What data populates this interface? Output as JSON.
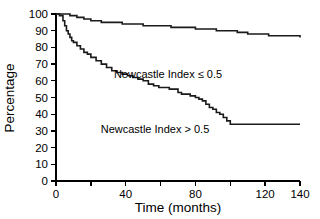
{
  "chart_data": {
    "type": "line",
    "subtype": "kaplan-meier-step",
    "title": "",
    "xlabel": "Time (months)",
    "ylabel": "Percentage",
    "xlim": [
      0,
      140
    ],
    "ylim": [
      0,
      100
    ],
    "xticks": [
      0,
      20,
      40,
      60,
      80,
      100,
      120,
      140
    ],
    "xtick_labels": [
      "0",
      "",
      "40",
      "",
      "80",
      "",
      "120",
      "140"
    ],
    "xtick_labels_major": [
      "0",
      "40",
      "80",
      "120",
      "140"
    ],
    "yticks": [
      0,
      10,
      20,
      30,
      40,
      50,
      60,
      70,
      80,
      90,
      100
    ],
    "ytick_labels": [
      "0",
      "10",
      "20",
      "30",
      "40",
      "50",
      "60",
      "70",
      "80",
      "90",
      "100"
    ],
    "grid": false,
    "legend_position": "inline-annotations",
    "series": [
      {
        "name": "Newcastle Index ≤ 0.5",
        "label_x": 168,
        "label_y": 78,
        "color": "#1a1a1a",
        "x": [
          0,
          4,
          8,
          12,
          16,
          20,
          26,
          32,
          38,
          44,
          50,
          56,
          62,
          66,
          70,
          74,
          80,
          86,
          92,
          98,
          104,
          110,
          116,
          122,
          128,
          134,
          140,
          146,
          152,
          158,
          164,
          170,
          176,
          182,
          188,
          192,
          196,
          200,
          210,
          220,
          230,
          240
        ],
        "y": [
          100,
          100,
          99,
          98,
          97,
          96,
          95,
          95,
          94,
          94,
          93,
          93,
          93,
          92,
          92,
          92,
          91,
          91,
          90,
          90,
          89,
          88,
          88,
          87,
          87,
          87,
          86,
          86,
          85,
          84,
          83,
          82,
          81,
          80,
          79,
          79,
          77,
          74,
          74,
          74,
          74,
          74
        ]
      },
      {
        "name": "Newcastle Index > 0.5",
        "label_x": 155,
        "label_y": 133,
        "color": "#1a1a1a",
        "x": [
          0,
          2,
          4,
          5,
          6,
          7,
          8,
          9,
          10,
          12,
          14,
          16,
          18,
          20,
          23,
          26,
          29,
          32,
          35,
          38,
          41,
          44,
          47,
          50,
          53,
          56,
          59,
          62,
          65,
          68,
          70,
          72,
          74,
          77,
          80,
          82,
          84,
          86,
          88,
          90,
          92,
          94,
          96,
          98,
          100,
          110,
          120,
          130,
          140
        ],
        "y": [
          100,
          99,
          96,
          93,
          90,
          88,
          86,
          84,
          83,
          81,
          79,
          77,
          76,
          74,
          72,
          70,
          68,
          66,
          65,
          64,
          63,
          62,
          61,
          60,
          58,
          57,
          56,
          56,
          55,
          55,
          53,
          52,
          52,
          51,
          50,
          49,
          48,
          46,
          44,
          43,
          41,
          40,
          38,
          36,
          34,
          34,
          34,
          34,
          34
        ]
      }
    ]
  }
}
